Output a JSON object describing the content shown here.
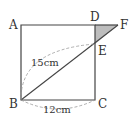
{
  "diagram": {
    "type": "geometry",
    "shape": "square ABCD with line from B through E (on DC) extended to F (on extension of AD)",
    "points": {
      "A": {
        "label": "A",
        "x": 21,
        "y": 25
      },
      "B": {
        "label": "B",
        "x": 21,
        "y": 100
      },
      "C": {
        "label": "C",
        "x": 95,
        "y": 100
      },
      "D": {
        "label": "D",
        "x": 95,
        "y": 25
      },
      "E": {
        "label": "E",
        "x": 95,
        "y": 44
      },
      "F": {
        "label": "F",
        "x": 118,
        "y": 25
      }
    },
    "measurements": {
      "BE": "15cm",
      "BC": "12cm"
    },
    "shaded_region": "triangle DEF",
    "colors": {
      "line": "#444444",
      "shade": "#bdbdbd",
      "dash": "#999999"
    }
  }
}
